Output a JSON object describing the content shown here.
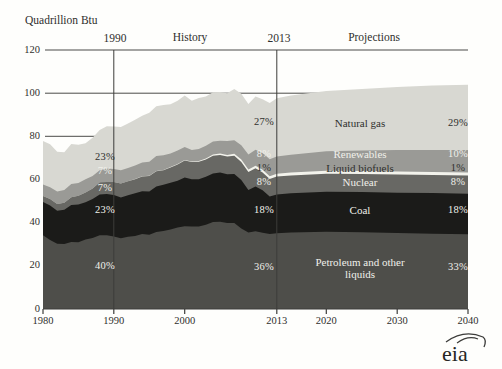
{
  "header": {
    "units_label": "Quadrillion Btu",
    "history_label": "History",
    "projections_label": "Projections",
    "divider_1990_label": "1990",
    "divider_2013_label": "2013"
  },
  "logo": {
    "text": "eia"
  },
  "chart_data": {
    "type": "area",
    "stacked": true,
    "title": "Quadrillion Btu",
    "xlabel": "",
    "ylabel": "Quadrillion Btu",
    "xlim": [
      1980,
      2040
    ],
    "ylim": [
      0,
      120
    ],
    "grid": "horizontal-behind-areas",
    "x_ticks": [
      1980,
      1990,
      2000,
      2013,
      2020,
      2030,
      2040
    ],
    "y_ticks": [
      0,
      20,
      40,
      60,
      80,
      100,
      120
    ],
    "divider_years": [
      1990,
      2013
    ],
    "annotations": [
      "History",
      "Projections",
      "1990",
      "2013"
    ],
    "x": [
      1980,
      1981,
      1982,
      1983,
      1984,
      1985,
      1986,
      1987,
      1988,
      1989,
      1990,
      1991,
      1992,
      1993,
      1994,
      1995,
      1996,
      1997,
      1998,
      1999,
      2000,
      2001,
      2002,
      2003,
      2004,
      2005,
      2006,
      2007,
      2008,
      2009,
      2010,
      2011,
      2012,
      2013,
      2015,
      2020,
      2025,
      2030,
      2035,
      2040
    ],
    "series": [
      {
        "key": "petroleum",
        "name": "Petroleum and other liquids",
        "color": "#4e4e4a",
        "text": "light",
        "shares": {
          "1990": "40%",
          "2013": "36%",
          "2040": "33%"
        },
        "values": [
          34.2,
          32.0,
          30.2,
          30.1,
          31.1,
          30.9,
          32.2,
          32.9,
          34.2,
          34.2,
          33.6,
          32.8,
          33.5,
          33.8,
          34.7,
          34.4,
          35.7,
          36.2,
          36.8,
          37.8,
          38.3,
          38.2,
          38.2,
          39.0,
          40.3,
          40.4,
          39.9,
          39.8,
          37.3,
          35.4,
          36.0,
          35.3,
          34.7,
          35.1,
          35.4,
          35.8,
          35.6,
          35.2,
          34.9,
          34.6
        ]
      },
      {
        "key": "coal",
        "name": "Coal",
        "color": "#1b1b19",
        "text": "light",
        "shares": {
          "1990": "23%",
          "2013": "18%",
          "2040": "18%"
        },
        "values": [
          15.4,
          15.9,
          15.3,
          15.9,
          17.1,
          17.5,
          17.3,
          18.0,
          18.8,
          19.1,
          19.2,
          18.8,
          19.2,
          19.8,
          19.9,
          20.1,
          21.0,
          21.4,
          21.7,
          21.6,
          22.6,
          21.9,
          21.9,
          22.3,
          22.5,
          22.8,
          22.5,
          22.7,
          22.4,
          19.7,
          20.8,
          19.7,
          17.4,
          18.0,
          18.2,
          18.5,
          18.6,
          18.7,
          18.8,
          18.8
        ]
      },
      {
        "key": "nuclear",
        "name": "Nuclear",
        "color": "#686864",
        "text": "light",
        "shares": {
          "1990": "7%",
          "2013": "8%",
          "2040": "8%"
        },
        "values": [
          2.7,
          3.0,
          3.1,
          3.2,
          3.6,
          4.1,
          4.5,
          4.9,
          5.7,
          5.6,
          6.1,
          6.5,
          6.5,
          6.5,
          6.8,
          7.1,
          7.1,
          6.7,
          7.1,
          7.6,
          7.9,
          8.0,
          8.1,
          7.9,
          8.2,
          8.2,
          8.2,
          8.5,
          8.4,
          8.4,
          8.4,
          8.3,
          8.1,
          8.3,
          8.3,
          8.4,
          8.4,
          8.4,
          8.4,
          8.4
        ]
      },
      {
        "key": "biofuels",
        "name": "Liquid biofuels",
        "color": "#f3f3ec",
        "text": "dark",
        "shares": {
          "1990": "",
          "2013": "1%",
          "2040": "1%"
        },
        "values": [
          0,
          0,
          0,
          0,
          0,
          0,
          0,
          0,
          0,
          0,
          0,
          0,
          0,
          0.1,
          0.15,
          0.15,
          0.15,
          0.15,
          0.2,
          0.2,
          0.25,
          0.3,
          0.4,
          0.5,
          0.55,
          0.6,
          0.8,
          0.9,
          1.1,
          1.2,
          1.2,
          1.25,
          1.3,
          1.3,
          1.3,
          1.35,
          1.35,
          1.4,
          1.4,
          1.4
        ]
      },
      {
        "key": "renewables",
        "name": "Renewables",
        "color": "#9a9a96",
        "text": "light",
        "shares": {
          "1990": "7%",
          "2013": "8%",
          "2040": "10%"
        },
        "values": [
          5.4,
          5.5,
          5.8,
          6.0,
          6.1,
          5.9,
          6.1,
          5.8,
          5.6,
          6.2,
          6.0,
          6.2,
          6.1,
          6.3,
          6.3,
          6.5,
          6.9,
          6.8,
          6.3,
          6.3,
          6.0,
          5.3,
          5.6,
          5.9,
          6.0,
          6.0,
          6.4,
          6.3,
          6.7,
          6.9,
          7.4,
          7.7,
          7.9,
          8.0,
          8.3,
          9.0,
          9.5,
          9.9,
          10.2,
          10.4
        ]
      },
      {
        "key": "natural_gas",
        "name": "Natural gas",
        "color": "#d8d8d2",
        "text": "dark",
        "shares": {
          "1990": "23%",
          "2013": "27%",
          "2040": "29%"
        },
        "values": [
          20.2,
          19.9,
          18.5,
          17.4,
          18.5,
          17.7,
          16.7,
          17.7,
          18.6,
          19.6,
          19.6,
          20.0,
          20.7,
          21.2,
          21.7,
          22.7,
          23.1,
          23.2,
          22.8,
          23.0,
          23.8,
          22.8,
          23.5,
          22.8,
          22.9,
          22.6,
          22.2,
          23.7,
          23.8,
          23.4,
          24.6,
          24.9,
          26.1,
          26.9,
          27.4,
          27.9,
          28.5,
          29.2,
          29.8,
          30.3
        ]
      }
    ]
  }
}
